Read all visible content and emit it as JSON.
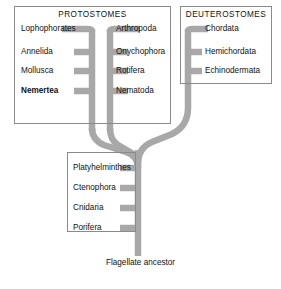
{
  "figure": {
    "type": "phylogenetic-tree",
    "root_label": "Flagellate ancestor",
    "branch_color": "#a8a8a8",
    "box_border_color": "#8a8a8a",
    "text_color": "#111111",
    "background": "#ffffff"
  },
  "groups": [
    {
      "id": "protostomes",
      "title": "PROTOSTOMES",
      "left_column": [
        {
          "label": "Lophophorates",
          "bold": false
        },
        {
          "label": "Annelida",
          "bold": false
        },
        {
          "label": "Mollusca",
          "bold": false
        },
        {
          "label": "Nemertea",
          "bold": true
        }
      ],
      "right_column": [
        {
          "label": "Arthropoda",
          "bold": false
        },
        {
          "label": "Onychophora",
          "bold": false
        },
        {
          "label": "Rotifera",
          "bold": false
        },
        {
          "label": "Nematoda",
          "bold": false
        }
      ]
    },
    {
      "id": "deuterostomes",
      "title": "DEUTEROSTOMES",
      "right_column": [
        {
          "label": "Chordata",
          "bold": false
        },
        {
          "label": "Hemichordata",
          "bold": false
        },
        {
          "label": "Echinodermata",
          "bold": false
        }
      ]
    },
    {
      "id": "basal",
      "title": "",
      "left_column": [
        {
          "label": "Platyhelminthes",
          "bold": false
        },
        {
          "label": "Ctenophora",
          "bold": false
        },
        {
          "label": "Cnidaria",
          "bold": false
        },
        {
          "label": "Porifera",
          "bold": false
        }
      ]
    }
  ],
  "labels": {
    "proto_l_0": "Lophophorates",
    "proto_l_1": "Annelida",
    "proto_l_2": "Mollusca",
    "proto_l_3": "Nemertea",
    "proto_r_0": "Arthropoda",
    "proto_r_1": "Onychophora",
    "proto_r_2": "Rotifera",
    "proto_r_3": "Nematoda",
    "deut_0": "Chordata",
    "deut_1": "Hemichordata",
    "deut_2": "Echinodermata",
    "basal_0": "Platyhelminthes",
    "basal_1": "Ctenophora",
    "basal_2": "Cnidaria",
    "basal_3": "Porifera",
    "title_protostomes": "PROTOSTOMES",
    "title_deuterostomes": "DEUTEROSTOMES",
    "root": "Flagellate ancestor"
  }
}
